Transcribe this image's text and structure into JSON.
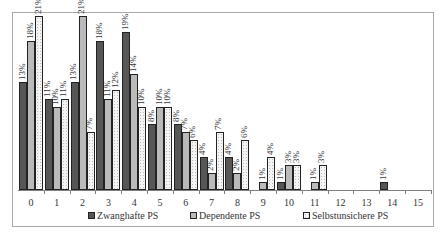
{
  "chart_data": {
    "type": "bar",
    "title": "",
    "xlabel": "",
    "ylabel": "",
    "categories": [
      "0",
      "1",
      "2",
      "3",
      "4",
      "5",
      "6",
      "7",
      "8",
      "9",
      "10",
      "11",
      "12",
      "13",
      "14",
      "15"
    ],
    "series": [
      {
        "name": "Zwanghafte PS",
        "values": [
          13,
          11,
          13,
          18,
          19,
          8,
          8,
          4,
          4,
          0,
          1,
          0,
          0,
          0,
          1,
          null
        ],
        "labels": [
          "13%",
          "11%",
          "13%",
          "18%",
          "19%",
          "8%",
          "8%",
          "4%",
          "4%",
          "",
          "1%",
          "",
          "",
          "",
          "1%",
          ""
        ]
      },
      {
        "name": "Dependente PS",
        "values": [
          18,
          10,
          21,
          11,
          14,
          10,
          7,
          2,
          2,
          1,
          3,
          1,
          0,
          0,
          0,
          null
        ],
        "labels": [
          "18%",
          "10%",
          "21%",
          "11%",
          "14%",
          "10%",
          "7%",
          "2%",
          "2%",
          "1%",
          "3%",
          "1%",
          "",
          "",
          "",
          ""
        ]
      },
      {
        "name": "Selbstunsichere PS",
        "values": [
          21,
          11,
          7,
          12,
          10,
          10,
          6,
          7,
          6,
          4,
          3,
          3,
          0,
          0,
          0,
          null
        ],
        "labels": [
          "21%",
          "11%",
          "7%",
          "12%",
          "10%",
          "10%",
          "6%",
          "7%",
          "6%",
          "4%",
          "3%",
          "3%",
          "",
          "",
          "",
          ""
        ]
      }
    ],
    "ylim": [
      0,
      21
    ],
    "grid": false,
    "legend_position": "bottom",
    "value_label_format": "percent, rotated vertical"
  },
  "legend": {
    "items": [
      {
        "label": "Zwanghafte PS"
      },
      {
        "label": "Dependente PS"
      },
      {
        "label": "Selbstunsichere PS"
      }
    ]
  }
}
